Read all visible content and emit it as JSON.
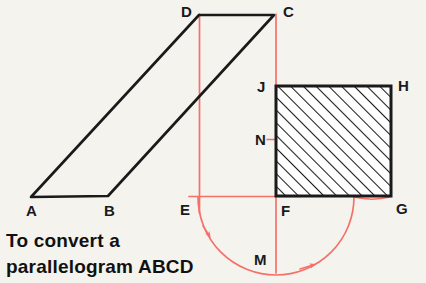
{
  "figure": {
    "background_color": "#f5f3ee",
    "ink_color": "#1a1a1a",
    "construction_color": "#f4716a",
    "shapes": {
      "parallelogram": {
        "name": "ABCD",
        "vertices": [
          {
            "label": "A",
            "x": 31,
            "y": 197
          },
          {
            "label": "B",
            "x": 108,
            "y": 196
          },
          {
            "label": "C",
            "x": 274,
            "y": 15
          },
          {
            "label": "D",
            "x": 199,
            "y": 15
          }
        ]
      },
      "rectangle": {
        "name": "JFGH",
        "hatched": true,
        "hatch_angle_deg": 45,
        "vertices": [
          {
            "label": "J",
            "x": 275,
            "y": 85
          },
          {
            "label": "H",
            "x": 392,
            "y": 85
          },
          {
            "label": "G",
            "x": 392,
            "y": 197
          },
          {
            "label": "F",
            "x": 275,
            "y": 197
          }
        ]
      }
    },
    "construction": {
      "vertical_line_left": {
        "x": 199,
        "y1": 15,
        "y2": 212
      },
      "vertical_line_right": {
        "x": 276,
        "y1": 15,
        "y2": 272
      },
      "horizontal_line": {
        "y": 196,
        "x1": 190,
        "x2": 300
      },
      "tick_at_n": {
        "x1": 268,
        "x2": 288,
        "y": 139
      },
      "arc": {
        "center_x": 276,
        "center_y": 197,
        "radius": 78,
        "from_label": "E",
        "through_label": "M",
        "to_label": "G"
      },
      "arrowheads": 2
    },
    "labels": [
      {
        "id": "A",
        "text": "A",
        "x": 26,
        "y": 216
      },
      {
        "id": "B",
        "text": "B",
        "x": 104,
        "y": 216
      },
      {
        "id": "C",
        "text": "C",
        "x": 283,
        "y": 17
      },
      {
        "id": "D",
        "text": "D",
        "x": 181,
        "y": 17
      },
      {
        "id": "E",
        "text": "E",
        "x": 180,
        "y": 215
      },
      {
        "id": "F",
        "text": "F",
        "x": 281,
        "y": 216
      },
      {
        "id": "G",
        "text": "G",
        "x": 396,
        "y": 214
      },
      {
        "id": "H",
        "text": "H",
        "x": 398,
        "y": 91
      },
      {
        "id": "J",
        "text": "J",
        "x": 257,
        "y": 92
      },
      {
        "id": "M",
        "text": "M",
        "x": 254,
        "y": 265
      },
      {
        "id": "N",
        "text": "N",
        "x": 255,
        "y": 145
      }
    ],
    "caption": {
      "line1": "To convert a",
      "line2": "parallelogram ABCD",
      "line1_x": 6,
      "line1_y": 247,
      "line2_x": 6,
      "line2_y": 273
    }
  }
}
